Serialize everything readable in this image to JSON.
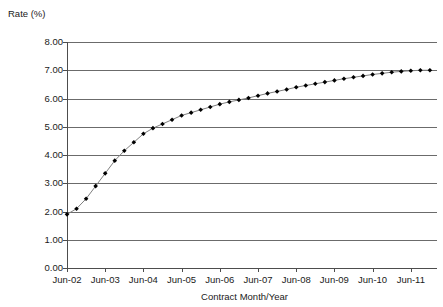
{
  "chart_data": {
    "type": "line",
    "title": "",
    "ylabel": "Rate (%)",
    "xlabel": "Contract Month/Year",
    "ylim": [
      0,
      8
    ],
    "ytick_labels": [
      "0.00",
      "1.00",
      "2.00",
      "3.00",
      "4.00",
      "5.00",
      "6.00",
      "7.00",
      "8.00"
    ],
    "ytick_values": [
      0,
      1,
      2,
      3,
      4,
      5,
      6,
      7,
      8
    ],
    "xtick_labels": [
      "Jun-02",
      "Jun-03",
      "Jun-04",
      "Jun-05",
      "Jun-06",
      "Jun-07",
      "Jun-08",
      "Jun-09",
      "Jun-10",
      "Jun-11"
    ],
    "grid": "horizontal",
    "legend": "none",
    "marker": "filled-diamond",
    "marker_color": "#000000",
    "line_color": "#808080",
    "series": [
      {
        "name": "Rate",
        "x": [
          "Jun-02",
          "Sep-02",
          "Dec-02",
          "Mar-03",
          "Jun-03",
          "Sep-03",
          "Dec-03",
          "Mar-04",
          "Jun-04",
          "Sep-04",
          "Dec-04",
          "Mar-05",
          "Jun-05",
          "Sep-05",
          "Dec-05",
          "Mar-06",
          "Jun-06",
          "Sep-06",
          "Dec-06",
          "Mar-07",
          "Jun-07",
          "Sep-07",
          "Dec-07",
          "Mar-08",
          "Jun-08",
          "Sep-08",
          "Dec-08",
          "Mar-09",
          "Jun-09",
          "Sep-09",
          "Dec-09",
          "Mar-10",
          "Jun-10",
          "Sep-10",
          "Dec-10",
          "Mar-11",
          "Jun-11",
          "Sep-11",
          "Dec-11"
        ],
        "values": [
          1.9,
          2.1,
          2.45,
          2.9,
          3.35,
          3.8,
          4.15,
          4.45,
          4.75,
          4.95,
          5.1,
          5.25,
          5.4,
          5.5,
          5.6,
          5.7,
          5.8,
          5.88,
          5.95,
          6.02,
          6.1,
          6.18,
          6.25,
          6.32,
          6.4,
          6.46,
          6.52,
          6.58,
          6.64,
          6.7,
          6.75,
          6.8,
          6.85,
          6.89,
          6.93,
          6.96,
          6.98,
          7.0,
          7.0
        ]
      }
    ]
  }
}
